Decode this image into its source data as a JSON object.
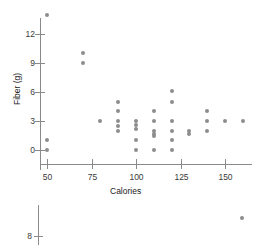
{
  "chart_data": {
    "type": "scatter",
    "title": "",
    "xlabel": "Calories",
    "ylabel": "Fiber (g)",
    "xlim": [
      40,
      170
    ],
    "ylim": [
      -1,
      15
    ],
    "xticks": [
      50,
      75,
      100,
      125,
      150
    ],
    "yticks": [
      0,
      3,
      6,
      9,
      12
    ],
    "xticklabels": [
      "50",
      "75",
      "100",
      "125",
      "150"
    ],
    "yticklabels": [
      "0",
      "3",
      "6",
      "9",
      "12"
    ],
    "grid": false,
    "legend": "none",
    "marker_color": "#8d8d8d",
    "axis_color": "#8a8a8a",
    "points": [
      {
        "x": 50,
        "y": 14.0
      },
      {
        "x": 50,
        "y": 1.0
      },
      {
        "x": 50,
        "y": 0.0
      },
      {
        "x": 70,
        "y": 10.0
      },
      {
        "x": 70,
        "y": 9.0
      },
      {
        "x": 80,
        "y": 3.0
      },
      {
        "x": 90,
        "y": 5.0
      },
      {
        "x": 90,
        "y": 4.0
      },
      {
        "x": 90,
        "y": 3.0
      },
      {
        "x": 90,
        "y": 2.5
      },
      {
        "x": 90,
        "y": 2.0
      },
      {
        "x": 100,
        "y": 3.0
      },
      {
        "x": 100,
        "y": 2.6
      },
      {
        "x": 100,
        "y": 2.2
      },
      {
        "x": 100,
        "y": 1.0
      },
      {
        "x": 100,
        "y": 0.0
      },
      {
        "x": 110,
        "y": 4.0
      },
      {
        "x": 110,
        "y": 3.0
      },
      {
        "x": 110,
        "y": 2.0
      },
      {
        "x": 110,
        "y": 1.7
      },
      {
        "x": 110,
        "y": 1.4
      },
      {
        "x": 110,
        "y": 0.0
      },
      {
        "x": 120,
        "y": 6.1
      },
      {
        "x": 120,
        "y": 5.0
      },
      {
        "x": 120,
        "y": 3.0
      },
      {
        "x": 120,
        "y": 2.0
      },
      {
        "x": 120,
        "y": 1.0
      },
      {
        "x": 120,
        "y": 0.0
      },
      {
        "x": 130,
        "y": 2.0
      },
      {
        "x": 130,
        "y": 1.7
      },
      {
        "x": 140,
        "y": 4.0
      },
      {
        "x": 140,
        "y": 3.0
      },
      {
        "x": 140,
        "y": 2.0
      },
      {
        "x": 150,
        "y": 3.0
      },
      {
        "x": 160,
        "y": 3.0
      }
    ]
  },
  "bottom_fragment": {
    "ytick_label": "8",
    "points": [
      {
        "px": 242,
        "py": 218
      }
    ]
  }
}
